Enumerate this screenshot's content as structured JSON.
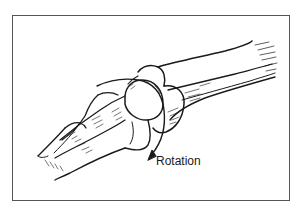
{
  "figure": {
    "label": "Rotation",
    "colors": {
      "ink": "#1a1a1a",
      "frame": "#555555",
      "background": "#ffffff"
    },
    "icons": [
      "rotation-arrow-icon"
    ]
  }
}
